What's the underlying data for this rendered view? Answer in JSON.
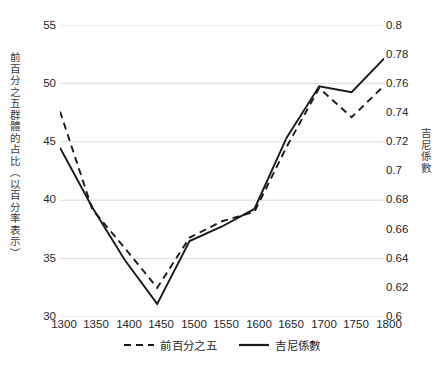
{
  "chart_data": {
    "type": "line",
    "title": "",
    "xlabel": "",
    "categories": [
      "1300",
      "1350",
      "1400",
      "1450",
      "1500",
      "1550",
      "1600",
      "1650",
      "1700",
      "1750",
      "1800"
    ],
    "grid": true,
    "legend_position": "bottom",
    "axes": {
      "left": {
        "label": "前百分之五群體的占比（以百分率表示）",
        "ticks": [
          "30",
          "35",
          "40",
          "45",
          "50",
          "55"
        ],
        "tick_values": [
          30,
          35,
          40,
          45,
          50,
          55
        ],
        "ylim": [
          30,
          55
        ]
      },
      "right": {
        "label": "吉尼係數",
        "ticks": [
          "0.6",
          "0.62",
          "0.64",
          "0.66",
          "0.68",
          "0.7",
          "0.72",
          "0.74",
          "0.76",
          "0.78",
          "0.8"
        ],
        "tick_values": [
          0.6,
          0.62,
          0.64,
          0.66,
          0.68,
          0.7,
          0.72,
          0.74,
          0.76,
          0.78,
          0.8
        ],
        "ylim": [
          0.6,
          0.8
        ]
      }
    },
    "series": [
      {
        "name": "前百分之五",
        "axis": "left",
        "style": "dashed",
        "color": "#1a1a1a",
        "values": [
          47.6,
          39.2,
          35.9,
          32.5,
          36.8,
          38.2,
          39.0,
          44.6,
          49.6,
          47.1,
          49.8
        ]
      },
      {
        "name": "吉尼係數",
        "axis": "right",
        "style": "solid",
        "color": "#1a1a1a",
        "values": [
          0.716,
          0.675,
          0.639,
          0.609,
          0.652,
          0.662,
          0.674,
          0.723,
          0.758,
          0.754,
          0.777
        ]
      }
    ],
    "legend": [
      {
        "label": "前百分之五",
        "style": "dashed"
      },
      {
        "label": "吉尼係數",
        "style": "solid"
      }
    ]
  }
}
